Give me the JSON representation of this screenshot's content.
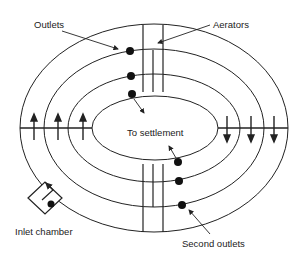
{
  "diagram": {
    "stroke_color": "#222222",
    "background": "#ffffff",
    "labels": {
      "outlets": "Outlets",
      "aerators": "Aerators",
      "to_settlement": "To settlement",
      "inlet_chamber": "Inlet chamber",
      "second_outlets": "Second outlets"
    },
    "channels": [
      {
        "name": "outer",
        "cx": 154,
        "cy": 128,
        "rx": 134,
        "ry": 104
      },
      {
        "name": "second",
        "cx": 154,
        "cy": 128,
        "rx": 110,
        "ry": 79
      },
      {
        "name": "third",
        "cx": 154,
        "cy": 128,
        "rx": 86,
        "ry": 54
      },
      {
        "name": "inner",
        "cx": 155,
        "cy": 128,
        "rx": 63,
        "ry": 32
      }
    ],
    "flow_arrows": {
      "left": {
        "direction": "up",
        "count": 3
      },
      "right": {
        "direction": "down",
        "count": 3
      }
    },
    "outlet_dots_top": 3,
    "outlet_dots_bottom": 3
  }
}
